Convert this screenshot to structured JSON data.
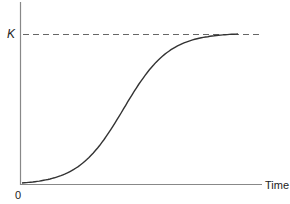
{
  "chart_data": {
    "type": "line",
    "title": "",
    "xlabel": "Time",
    "ylabel": "",
    "origin_label": "0",
    "grid": false,
    "legend": null,
    "series": [
      {
        "name": "logistic growth",
        "style": "solid",
        "color": "#333333",
        "x": [
          0,
          0.1,
          0.2,
          0.3,
          0.4,
          0.5,
          0.6,
          0.7,
          0.8,
          0.9,
          1.0
        ],
        "values": [
          0.01,
          0.04,
          0.11,
          0.24,
          0.43,
          0.62,
          0.79,
          0.9,
          0.96,
          0.99,
          1.0
        ]
      }
    ],
    "reference_lines": [
      {
        "axis": "y",
        "value": 1.0,
        "label": "K",
        "style": "dashed",
        "color": "#555555"
      }
    ],
    "xlim": [
      0,
      1.1
    ],
    "ylim": [
      0,
      1.05
    ],
    "annotations": [
      {
        "text": "K",
        "position": "y-axis at carrying capacity"
      }
    ]
  },
  "labels": {
    "k": "K",
    "zero": "0",
    "x_axis": "Time"
  }
}
